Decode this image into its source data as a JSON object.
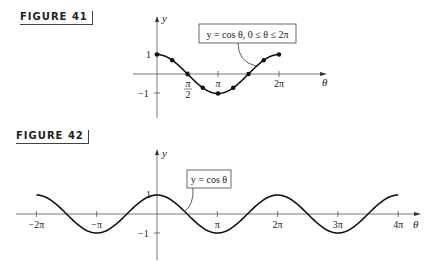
{
  "figure41": {
    "label": "FIGURE 41",
    "caption": "y = cos θ, 0 ≤ θ ≤ 2π",
    "y_axis_label": "y",
    "x_axis_label": "θ",
    "y_ticks": [
      "1",
      "−1"
    ],
    "x_ticks": [
      "π/2",
      "π",
      "2π"
    ]
  },
  "figure42": {
    "label": "FIGURE 42",
    "caption": "y = cos θ",
    "y_axis_label": "y",
    "x_axis_label": "θ",
    "y_ticks": [
      "1",
      "−1"
    ],
    "x_ticks": [
      "−2π",
      "−π",
      "π",
      "2π",
      "3π",
      "4π"
    ]
  },
  "chart_data": [
    {
      "type": "line",
      "title": "FIGURE 41",
      "annotation": "y = cos θ, 0 ≤ θ ≤ 2π",
      "xlabel": "θ",
      "ylabel": "y",
      "x": [
        "0",
        "π/4",
        "π/2",
        "3π/4",
        "π",
        "5π/4",
        "3π/2",
        "7π/4",
        "2π"
      ],
      "x_numeric": [
        0,
        0.7854,
        1.5708,
        2.3562,
        3.1416,
        3.927,
        4.7124,
        5.4978,
        6.2832
      ],
      "series": [
        {
          "name": "y = cos θ",
          "values": [
            1,
            0.707,
            0,
            -0.707,
            -1,
            -0.707,
            0,
            0.707,
            1
          ],
          "markers": true
        }
      ],
      "xticks": [
        "π/2",
        "π",
        "2π"
      ],
      "yticks": [
        "1",
        "−1"
      ],
      "xlim": [
        -0.8,
        8.0
      ],
      "ylim": [
        -1.3,
        2.8
      ],
      "grid": false,
      "legend": "none"
    },
    {
      "type": "line",
      "title": "FIGURE 42",
      "annotation": "y = cos θ",
      "xlabel": "θ",
      "ylabel": "y",
      "x": [
        "−2π",
        "−3π/2",
        "−π",
        "−π/2",
        "0",
        "π/2",
        "π",
        "3π/2",
        "2π",
        "5π/2",
        "3π",
        "7π/2",
        "4π"
      ],
      "x_numeric": [
        -6.2832,
        -4.7124,
        -3.1416,
        -1.5708,
        0,
        1.5708,
        3.1416,
        4.7124,
        6.2832,
        7.854,
        9.4248,
        10.9956,
        12.5664
      ],
      "series": [
        {
          "name": "y = cos θ",
          "values": [
            1,
            0,
            -1,
            0,
            1,
            0,
            -1,
            0,
            1,
            0,
            -1,
            0,
            1
          ],
          "markers": false
        }
      ],
      "xticks": [
        "−2π",
        "−π",
        "π",
        "2π",
        "3π",
        "4π"
      ],
      "yticks": [
        "1",
        "−1"
      ],
      "xlim": [
        -6.5,
        13.9
      ],
      "ylim": [
        -2.5,
        2.5
      ],
      "grid": false,
      "legend": "none"
    }
  ]
}
